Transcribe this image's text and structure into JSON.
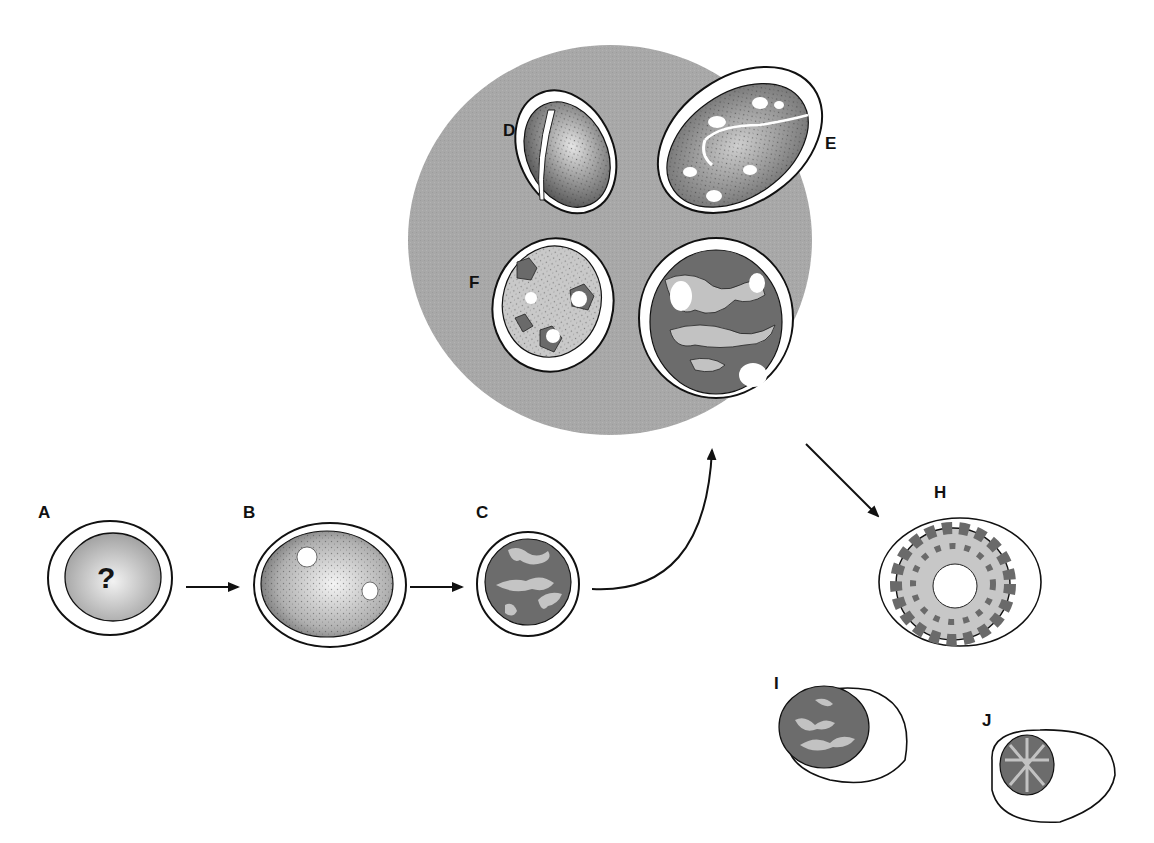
{
  "diagram": {
    "type": "cell developmental sequence illustration",
    "highlight_group": [
      "D",
      "E",
      "F",
      "G"
    ],
    "colors": {
      "background": "#ffffff",
      "highlight_ellipse": "#a8a8a8",
      "nucleus_dark": "#6a6a6a",
      "nucleus_light": "#c8c8c8",
      "outline": "#1a1a1a"
    },
    "stages": [
      {
        "id": "A",
        "label": "A",
        "symbol": "?"
      },
      {
        "id": "B",
        "label": "B"
      },
      {
        "id": "C",
        "label": "C"
      },
      {
        "id": "D",
        "label": "D"
      },
      {
        "id": "E",
        "label": "E"
      },
      {
        "id": "F",
        "label": "F"
      },
      {
        "id": "G",
        "label": "G"
      },
      {
        "id": "H",
        "label": "H"
      },
      {
        "id": "I",
        "label": "I"
      },
      {
        "id": "J",
        "label": "J"
      }
    ],
    "arrows": [
      {
        "from": "A",
        "to": "B"
      },
      {
        "from": "B",
        "to": "C"
      },
      {
        "from": "C",
        "to": "DEFG-group"
      },
      {
        "from": "DEFG-group",
        "to": "H"
      }
    ]
  }
}
